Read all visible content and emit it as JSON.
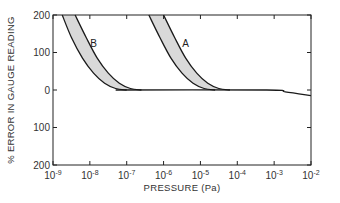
{
  "chart_data": {
    "type": "area",
    "title": "",
    "xlabel": "PRESSURE (Pa)",
    "ylabel": "% ERROR IN GAUGE READING",
    "xscale": "log",
    "xlim": [
      1e-09,
      0.01
    ],
    "ylim": [
      -200,
      200
    ],
    "grid": false,
    "x_ticks": [
      "10^-9",
      "10^-8",
      "10^-7",
      "10^-6",
      "10^-5",
      "10^-4",
      "10^-3",
      "10^-2"
    ],
    "x_tick_exponents": [
      -9,
      -8,
      -7,
      -6,
      -5,
      -4,
      -3,
      -2
    ],
    "y_ticks": [
      200,
      100,
      0,
      100,
      200
    ],
    "y_tick_values": [
      200,
      100,
      0,
      -100,
      -200
    ],
    "baseline": {
      "name": "zero-error line",
      "points_logx_y": [
        [
          -7.3,
          0
        ],
        [
          -3.2,
          0
        ],
        [
          -2.7,
          -5
        ],
        [
          -2.0,
          -15
        ]
      ]
    },
    "series": [
      {
        "name": "B",
        "description": "shaded band, error vs pressure",
        "lower_edge_logx_y": [
          [
            -8.75,
            200
          ],
          [
            -8.5,
            140
          ],
          [
            -8.2,
            85
          ],
          [
            -7.9,
            45
          ],
          [
            -7.6,
            18
          ],
          [
            -7.3,
            4
          ],
          [
            -7.0,
            0
          ]
        ],
        "upper_edge_logx_y": [
          [
            -8.4,
            200
          ],
          [
            -8.1,
            140
          ],
          [
            -7.8,
            85
          ],
          [
            -7.5,
            45
          ],
          [
            -7.2,
            18
          ],
          [
            -6.9,
            4
          ],
          [
            -6.6,
            0
          ]
        ]
      },
      {
        "name": "A",
        "description": "shaded band, error vs pressure",
        "lower_edge_logx_y": [
          [
            -6.4,
            200
          ],
          [
            -6.1,
            140
          ],
          [
            -5.8,
            85
          ],
          [
            -5.5,
            45
          ],
          [
            -5.2,
            18
          ],
          [
            -4.9,
            4
          ],
          [
            -4.6,
            0
          ]
        ],
        "upper_edge_logx_y": [
          [
            -6.0,
            200
          ],
          [
            -5.7,
            140
          ],
          [
            -5.4,
            85
          ],
          [
            -5.1,
            45
          ],
          [
            -4.8,
            18
          ],
          [
            -4.5,
            4
          ],
          [
            -4.2,
            0
          ]
        ]
      }
    ],
    "annotations": [
      {
        "text": "B",
        "logx": -7.9,
        "y": 115
      },
      {
        "text": "A",
        "logx": -5.4,
        "y": 115
      }
    ],
    "fill_color": "#d9d9d9",
    "line_color": "#1a1a1a"
  }
}
